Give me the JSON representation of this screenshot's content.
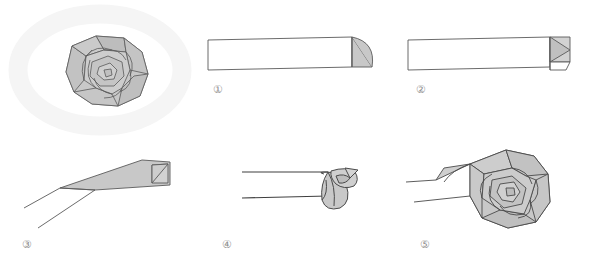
{
  "figure": {
    "kind": "origami-folding-instruction-diagram",
    "background_color": "#ffffff",
    "line_color": "#4a4a4a",
    "fill_color": "#c8c8c8",
    "fill_color_light": "#d6d6d6",
    "halo_color": "#ededed",
    "label_color": "#8e8e8e",
    "panel_count": 5
  },
  "panels": [
    {
      "id": "finished-rose",
      "label": "",
      "caption": "",
      "description": "Completed spiral rose seen from above, resting on a faint pale oval halo",
      "position": {
        "x": 15,
        "y": 8,
        "w": 175,
        "h": 125
      }
    },
    {
      "id": "step-1",
      "label": "①",
      "number": 1,
      "caption": "",
      "description": "Long narrow strip, right end folded down into a shaded triangular flap with a curved edge",
      "position": {
        "x": 200,
        "y": 20,
        "w": 190,
        "h": 100
      }
    },
    {
      "id": "step-2",
      "label": "②",
      "number": 2,
      "caption": "",
      "description": "Same strip with the triangular flap folded back over itself at the right end",
      "position": {
        "x": 400,
        "y": 20,
        "w": 190,
        "h": 100
      }
    },
    {
      "id": "step-3",
      "label": "③",
      "number": 3,
      "caption": "",
      "description": "Strip viewed at an angle, tapering to the lower left, folded tip detail at the upper right",
      "position": {
        "x": 10,
        "y": 145,
        "w": 190,
        "h": 100
      }
    },
    {
      "id": "step-4",
      "label": "④",
      "number": 4,
      "caption": "",
      "description": "Strip being rolled at the right end, first bud of the rose forming",
      "position": {
        "x": 210,
        "y": 145,
        "w": 190,
        "h": 100
      }
    },
    {
      "id": "step-5",
      "label": "⑤",
      "number": 5,
      "caption": "",
      "description": "Rose nearly finished, petals spiralled around the centre with the strip tail trailing left",
      "position": {
        "x": 410,
        "y": 145,
        "w": 190,
        "h": 100
      }
    }
  ],
  "labels": {
    "one": "①",
    "two": "②",
    "three": "③",
    "four": "④",
    "five": "⑤"
  }
}
